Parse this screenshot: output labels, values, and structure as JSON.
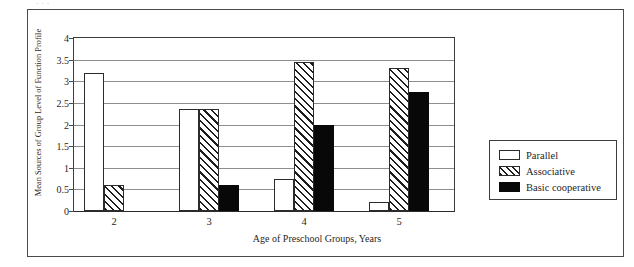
{
  "figure": {
    "top_remnant_text": "· · ·"
  },
  "chart_data": {
    "type": "bar",
    "title": "",
    "xlabel": "Age of Preschool Groups, Years",
    "ylabel": "Mean Sources of Group Level of Function Profile",
    "categories": [
      "2",
      "3",
      "4",
      "5"
    ],
    "ylim": [
      0,
      4
    ],
    "ytick_labels": [
      "0",
      "0.5",
      "1",
      "1.5",
      "2",
      "2.5",
      "3",
      "3.5",
      "4"
    ],
    "ytick_values": [
      0,
      0.5,
      1,
      1.5,
      2,
      2.5,
      3,
      3.5,
      4
    ],
    "grid": true,
    "legend_position": "right",
    "series": [
      {
        "name": "Parallel",
        "fill": "white",
        "values": [
          3.2,
          2.35,
          0.75,
          0.2
        ]
      },
      {
        "name": "Associative",
        "fill": "hatched",
        "values": [
          0.6,
          2.35,
          3.45,
          3.3
        ]
      },
      {
        "name": "Basic cooperative",
        "fill": "black",
        "values": [
          0,
          0.6,
          2.0,
          2.75
        ]
      }
    ]
  }
}
